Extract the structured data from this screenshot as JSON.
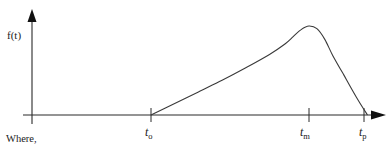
{
  "diagram": {
    "y_axis_label": "f(t)",
    "x_ticks": [
      {
        "id": "t0",
        "base": "t",
        "sub": "o"
      },
      {
        "id": "tm",
        "base": "t",
        "sub": "m"
      },
      {
        "id": "tp",
        "base": "t",
        "sub": "p"
      }
    ],
    "curve_description": "f(t) is zero before t_o, rises roughly linearly from t_o, reaches its maximum at t_m, then falls steeply back to zero at t_p",
    "caption": "Where,"
  },
  "chart_data": {
    "type": "line",
    "title": "",
    "xlabel": "t",
    "ylabel": "f(t)",
    "x_ticks": [
      "t_o",
      "t_m",
      "t_p"
    ],
    "y_ticks": [],
    "grid": false,
    "x_relative": [
      0.0,
      0.15,
      0.3,
      0.45,
      0.6,
      0.75,
      0.85,
      0.9,
      0.95,
      1.0,
      1.05,
      1.1,
      1.15,
      1.22,
      1.3,
      1.37
    ],
    "y_relative": [
      0.0,
      0.13,
      0.26,
      0.39,
      0.53,
      0.68,
      0.8,
      0.88,
      0.96,
      1.0,
      0.97,
      0.85,
      0.67,
      0.45,
      0.2,
      0.0
    ]
  }
}
